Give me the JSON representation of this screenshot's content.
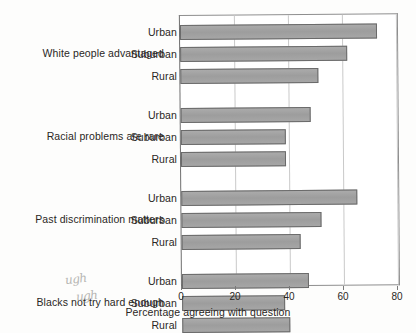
{
  "chart_data": {
    "type": "bar",
    "orientation": "horizontal",
    "title": "",
    "xlabel": "Percentage agreeing with question",
    "ylabel": "",
    "xlim": [
      0,
      80
    ],
    "xticks": [
      0,
      20,
      40,
      60,
      80
    ],
    "grid": true,
    "legend": false,
    "categories": [
      "Urban",
      "Suburban",
      "Rural"
    ],
    "groups": [
      {
        "label": "White people advantaged",
        "bars": [
          {
            "category": "Urban",
            "value": 73
          },
          {
            "category": "Suburban",
            "value": 62
          },
          {
            "category": "Rural",
            "value": 51
          }
        ]
      },
      {
        "label": "Racial problems are rare",
        "bars": [
          {
            "category": "Urban",
            "value": 48
          },
          {
            "category": "Suburban",
            "value": 39
          },
          {
            "category": "Rural",
            "value": 39
          }
        ]
      },
      {
        "label": "Past discrimination matters",
        "bars": [
          {
            "category": "Urban",
            "value": 65
          },
          {
            "category": "Suburban",
            "value": 52
          },
          {
            "category": "Rural",
            "value": 44
          }
        ]
      },
      {
        "label": "Blacks not try hard enough",
        "bars": [
          {
            "category": "Urban",
            "value": 47
          },
          {
            "category": "Suburban",
            "value": 38
          },
          {
            "category": "Rural",
            "value": 40
          }
        ]
      }
    ],
    "colors": {
      "bar_fill": "#a3a3a3",
      "bar_border": "#6a6a6a",
      "grid": "#c9c9c9",
      "axis": "#6f6f6f",
      "text": "#2a2724"
    }
  },
  "annotations": {
    "handwritten_notes": [
      "ugh",
      "ugh"
    ]
  }
}
